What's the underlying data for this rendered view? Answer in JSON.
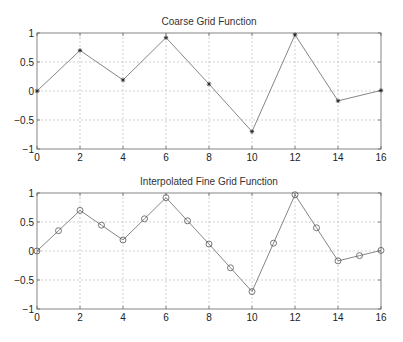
{
  "chart_data": [
    {
      "type": "line",
      "title": "Coarse Grid Function",
      "xlabel": "",
      "ylabel": "",
      "xlim": [
        0,
        16
      ],
      "ylim": [
        -1,
        1
      ],
      "xticks": [
        0,
        2,
        4,
        6,
        8,
        10,
        12,
        14,
        16
      ],
      "yticks": [
        -1,
        -0.5,
        0,
        0.5,
        1
      ],
      "ytick_labels": [
        "−1",
        "−0.5",
        "0",
        "0.5",
        "1"
      ],
      "grid": true,
      "marker": "*",
      "series": [
        {
          "name": "coarse",
          "x": [
            0,
            2,
            4,
            6,
            8,
            10,
            12,
            14,
            16
          ],
          "values": [
            0,
            0.7,
            0.19,
            0.92,
            0.12,
            -0.7,
            0.97,
            -0.17,
            0.01
          ]
        }
      ]
    },
    {
      "type": "line",
      "title": "Interpolated Fine Grid Function",
      "xlabel": "",
      "ylabel": "",
      "xlim": [
        0,
        16
      ],
      "ylim": [
        -1,
        1
      ],
      "xticks": [
        0,
        2,
        4,
        6,
        8,
        10,
        12,
        14,
        16
      ],
      "yticks": [
        -1,
        -0.5,
        0,
        0.5,
        1
      ],
      "ytick_labels": [
        "−1",
        "−0.5",
        "0",
        "0.5",
        "1"
      ],
      "grid": true,
      "marker": "o",
      "series": [
        {
          "name": "fine",
          "x": [
            0,
            1,
            2,
            3,
            4,
            5,
            6,
            7,
            8,
            9,
            10,
            11,
            12,
            13,
            14,
            15,
            16
          ],
          "values": [
            0,
            0.35,
            0.7,
            0.445,
            0.19,
            0.555,
            0.92,
            0.52,
            0.12,
            -0.29,
            -0.7,
            0.135,
            0.97,
            0.4,
            -0.17,
            -0.08,
            0.01
          ]
        }
      ]
    }
  ]
}
